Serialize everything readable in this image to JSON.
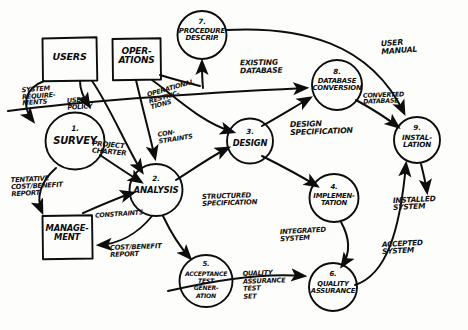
{
  "diagram": {
    "style": "hand-drawn",
    "ink_color": "#0d0d0d",
    "paper_color": "#fdfdfb"
  },
  "entities": [
    {
      "id": "users",
      "label": "USERS",
      "shape": "box",
      "x": 42,
      "y": 37,
      "w": 55,
      "h": 44
    },
    {
      "id": "operations",
      "label": "OPER-\nATIONS",
      "shape": "box",
      "x": 112,
      "y": 38,
      "w": 49,
      "h": 42
    },
    {
      "id": "management",
      "label": "MANAGE-\nMENT",
      "shape": "box",
      "x": 42,
      "y": 215,
      "w": 50,
      "h": 44
    }
  ],
  "processes": [
    {
      "id": "p1",
      "number": "1.",
      "label": "SURVEY",
      "cx": 75,
      "cy": 141,
      "r": 29
    },
    {
      "id": "p2",
      "number": "2.",
      "label": "ANALYSIS",
      "cx": 156,
      "cy": 190,
      "r": 26
    },
    {
      "id": "p3",
      "number": "3.",
      "label": "DESIGN",
      "cx": 250,
      "cy": 141,
      "r": 23
    },
    {
      "id": "p4",
      "number": "4.",
      "label": "IMPLEMEN-\nTATION",
      "cx": 334,
      "cy": 198,
      "r": 24
    },
    {
      "id": "p5",
      "number": "5.",
      "label": "ACCEPTANCE\nTEST\nGENER-\nATION",
      "cx": 206,
      "cy": 281,
      "r": 26
    },
    {
      "id": "p6",
      "number": "6.",
      "label": "QUALITY\nASSURANCE",
      "cx": 333,
      "cy": 287,
      "r": 24
    },
    {
      "id": "p7",
      "number": "7.",
      "label": "PROCEDURE\nDESCRIP.",
      "cx": 202,
      "cy": 35,
      "r": 24
    },
    {
      "id": "p8",
      "number": "8.",
      "label": "DATABASE\nCONVERSION",
      "cx": 337,
      "cy": 85,
      "r": 25
    },
    {
      "id": "p9",
      "number": "9.",
      "label": "INSTAL-\nLATION",
      "cx": 417,
      "cy": 140,
      "r": 23
    }
  ],
  "flow_labels": [
    {
      "id": "f1",
      "text": "SYSTEM\nREQUIRE-\nMENTS",
      "x": 22,
      "y": 86,
      "size": 6.6,
      "rotate": -4
    },
    {
      "id": "f2",
      "text": "USER\nPOLICY",
      "x": 67,
      "y": 97,
      "size": 6.6,
      "rotate": -4
    },
    {
      "id": "f3",
      "text": "PROJECT\nCHARTER",
      "x": 92,
      "y": 142,
      "size": 7.0,
      "rotate": 5
    },
    {
      "id": "f4",
      "text": "TENTATIVE\nCOST/BENEFIT\nREPORT",
      "x": 11,
      "y": 176,
      "size": 6.8,
      "rotate": -3
    },
    {
      "id": "f5",
      "text": "CONSTRAINTS",
      "x": 95,
      "y": 211,
      "size": 6.4,
      "rotate": -4
    },
    {
      "id": "f6",
      "text": "COST/BENEFIT\nREPORT",
      "x": 110,
      "y": 244,
      "size": 6.8,
      "rotate": -2
    },
    {
      "id": "f7",
      "text": "OPERATIONAL\nRESTRIC-\nTIONS",
      "x": 148,
      "y": 85,
      "size": 6.5,
      "rotate": -16
    },
    {
      "id": "f8",
      "text": "CON-\nSTRAINTS",
      "x": 158,
      "y": 129,
      "size": 6.5,
      "rotate": -9
    },
    {
      "id": "f9",
      "text": "EXISTING\nDATABASE",
      "x": 240,
      "y": 59,
      "size": 7.6,
      "rotate": -1
    },
    {
      "id": "f10",
      "text": "USER\nMANUAL",
      "x": 381,
      "y": 39,
      "size": 7.8,
      "rotate": -4
    },
    {
      "id": "f11",
      "text": "CONVERTED\nDATABASE",
      "x": 363,
      "y": 92,
      "size": 6.4,
      "rotate": -2
    },
    {
      "id": "f12",
      "text": "DESIGN\nSPECIFICATION",
      "x": 290,
      "y": 120,
      "size": 7.8,
      "rotate": -2
    },
    {
      "id": "f13",
      "text": "STRUCTURED\nSPECIFICATION",
      "x": 202,
      "y": 193,
      "size": 6.9,
      "rotate": -2
    },
    {
      "id": "f14",
      "text": "INTEGRATED\nSYSTEM",
      "x": 280,
      "y": 228,
      "size": 6.9,
      "rotate": -3
    },
    {
      "id": "f15",
      "text": "QUALITY\nASSURANCE\nTEST\nSET",
      "x": 243,
      "y": 270,
      "size": 6.6,
      "rotate": -2
    },
    {
      "id": "f16",
      "text": "INSTALLED\nSYSTEM",
      "x": 393,
      "y": 196,
      "size": 7.4,
      "rotate": -3
    },
    {
      "id": "f17",
      "text": "ACCEPTED\nSYSTEM",
      "x": 382,
      "y": 240,
      "size": 7.4,
      "rotate": -3
    }
  ],
  "connections": [
    {
      "id": "c1",
      "from": "users",
      "to": "p1",
      "label": "SYSTEM REQUIREMENTS"
    },
    {
      "id": "c2",
      "from": "users",
      "to": "p1",
      "label": "USER POLICY"
    },
    {
      "id": "c3",
      "from": "users",
      "to": "p2",
      "label": ""
    },
    {
      "id": "c4",
      "from": "p1",
      "to": "p2",
      "label": "PROJECT CHARTER"
    },
    {
      "id": "c5",
      "from": "p1",
      "to": "management",
      "label": "TENTATIVE COST/BENEFIT REPORT"
    },
    {
      "id": "c6",
      "from": "management",
      "to": "p2",
      "label": "CONSTRAINTS"
    },
    {
      "id": "c7",
      "from": "p2",
      "to": "management",
      "label": "COST/BENEFIT REPORT"
    },
    {
      "id": "c8",
      "from": "operations",
      "to": "p7",
      "label": "OPERATIONAL RESTRICTIONS"
    },
    {
      "id": "c9",
      "from": "operations",
      "to": "p2",
      "label": "CONSTRAINTS"
    },
    {
      "id": "c10",
      "from": "p2",
      "to": "p3",
      "label": "STRUCTURED SPECIFICATION"
    },
    {
      "id": "c11",
      "from": "p2",
      "to": "p5",
      "label": ""
    },
    {
      "id": "c12",
      "from": "p3",
      "to": "p8",
      "label": "DESIGN SPECIFICATION"
    },
    {
      "id": "c13",
      "from": "p3",
      "to": "p4",
      "label": "DESIGN SPECIFICATION"
    },
    {
      "id": "c14",
      "from": "existing-db",
      "to": "p8",
      "label": "EXISTING DATABASE"
    },
    {
      "id": "c15",
      "from": "p8",
      "to": "p9",
      "label": "CONVERTED DATABASE"
    },
    {
      "id": "c16",
      "from": "p7",
      "to": "p9",
      "label": "USER MANUAL"
    },
    {
      "id": "c17",
      "from": "p4",
      "to": "p6",
      "label": "INTEGRATED SYSTEM"
    },
    {
      "id": "c18",
      "from": "p5",
      "to": "p6",
      "label": "QUALITY ASSURANCE TEST SET"
    },
    {
      "id": "c19",
      "from": "p6",
      "to": "p9",
      "label": "ACCEPTED SYSTEM"
    },
    {
      "id": "c20",
      "from": "p9",
      "to": "installed",
      "label": "INSTALLED SYSTEM"
    }
  ]
}
